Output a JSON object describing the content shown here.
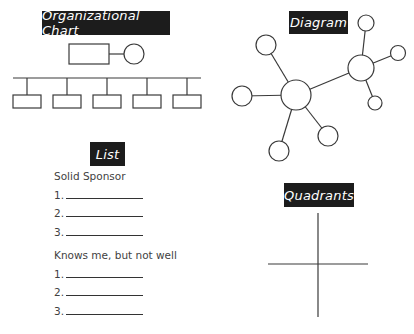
{
  "titles": {
    "org_chart": "Organizational Chart",
    "diagram": "Diagram",
    "list": "List",
    "quadrants": "Quadrants"
  },
  "list": {
    "groups": [
      {
        "heading": "Solid Sponsor",
        "items": [
          "1.",
          "2.",
          "3."
        ]
      },
      {
        "heading": "Knows me, but not well",
        "items": [
          "1.",
          "2.",
          "3."
        ]
      }
    ]
  },
  "colors": {
    "title_bg": "#1c1c1c",
    "title_text": "#ffffff",
    "line": "#3a3a3a",
    "text": "#3f3f3f"
  },
  "org_chart": {
    "top_node": {
      "shape": "rectangle",
      "partner": "circle"
    },
    "children_count": 5
  },
  "diagram": {
    "hubs": 2,
    "hub1_spokes": 4,
    "hub2_spokes": 3
  }
}
